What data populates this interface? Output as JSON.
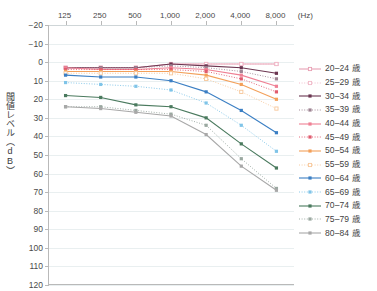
{
  "axes": {
    "y_title": "閾値レベル（dB）",
    "x_unit": "(Hz)",
    "x_ticks": [
      "125",
      "250",
      "500",
      "1,000",
      "2,000",
      "4,000",
      "8,000"
    ],
    "y_ticks": [
      "−20",
      "−10",
      "0",
      "10",
      "20",
      "30",
      "40",
      "50",
      "60",
      "70",
      "80",
      "90",
      "100",
      "110",
      "120"
    ]
  },
  "legend": {
    "items": [
      {
        "label": "20–24 歳",
        "color": "#e8a0b4",
        "dash": "solid",
        "marker": "square-open"
      },
      {
        "label": "25–29 歳",
        "color": "#f0b9c8",
        "dash": "dotted",
        "marker": "square-open"
      },
      {
        "label": "30–34 歳",
        "color": "#6b3550",
        "dash": "solid",
        "marker": "square-filled"
      },
      {
        "label": "35–39 歳",
        "color": "#9d8392",
        "dash": "dotted",
        "marker": "square-filled"
      },
      {
        "label": "40–44 歳",
        "color": "#ef8094",
        "dash": "solid",
        "marker": "square-filled"
      },
      {
        "label": "45–49 歳",
        "color": "#e05a6e",
        "dash": "dotted",
        "marker": "square-filled"
      },
      {
        "label": "50–54 歳",
        "color": "#f3a05a",
        "dash": "solid",
        "marker": "square-filled"
      },
      {
        "label": "55–59 歳",
        "color": "#f7c79a",
        "dash": "dotted",
        "marker": "square-open"
      },
      {
        "label": "60–64 歳",
        "color": "#3b7fc4",
        "dash": "solid",
        "marker": "square-filled"
      },
      {
        "label": "65–69 歳",
        "color": "#7fc4e8",
        "dash": "dotted",
        "marker": "square-filled"
      },
      {
        "label": "70–74 歳",
        "color": "#4a7a5e",
        "dash": "solid",
        "marker": "square-filled"
      },
      {
        "label": "75–79 歳",
        "color": "#9aa8a0",
        "dash": "dotted",
        "marker": "square-filled"
      },
      {
        "label": "80–84 歳",
        "color": "#a8a8a8",
        "dash": "solid",
        "marker": "square-filled"
      }
    ]
  },
  "chart_data": {
    "type": "line",
    "title": "",
    "xlabel": "(Hz)",
    "ylabel": "閾値レベル（dB）",
    "x": [
      125,
      250,
      500,
      1000,
      2000,
      4000,
      8000
    ],
    "x_tick_labels": [
      "125",
      "250",
      "500",
      "1,000",
      "2,000",
      "4,000",
      "8,000"
    ],
    "ylim": [
      -20,
      120
    ],
    "y_inverted": true,
    "y_ticks": [
      -20,
      -10,
      0,
      10,
      20,
      30,
      40,
      50,
      60,
      70,
      80,
      90,
      100,
      110,
      120
    ],
    "grid": true,
    "legend_position": "right",
    "series": [
      {
        "name": "20–24 歳",
        "color": "#e8a0b4",
        "dash": "solid",
        "marker": "square-open",
        "values": [
          3,
          3,
          3,
          1,
          1,
          1,
          1
        ]
      },
      {
        "name": "25–29 歳",
        "color": "#f0b9c8",
        "dash": "dotted",
        "marker": "square-open",
        "values": [
          3,
          3,
          3,
          1,
          1,
          1,
          1
        ]
      },
      {
        "name": "30–34 歳",
        "color": "#6b3550",
        "dash": "solid",
        "marker": "square-filled",
        "values": [
          3,
          3,
          3,
          1,
          2,
          3,
          6
        ]
      },
      {
        "name": "35–39 歳",
        "color": "#9d8392",
        "dash": "dotted",
        "marker": "square-filled",
        "values": [
          3,
          3,
          3,
          2,
          3,
          5,
          9
        ]
      },
      {
        "name": "40–44 歳",
        "color": "#ef8094",
        "dash": "solid",
        "marker": "square-filled",
        "values": [
          3,
          4,
          4,
          3,
          4,
          7,
          13
        ]
      },
      {
        "name": "45–49 歳",
        "color": "#e05a6e",
        "dash": "dotted",
        "marker": "square-filled",
        "values": [
          4,
          4,
          4,
          4,
          5,
          9,
          16
        ]
      },
      {
        "name": "50–54 歳",
        "color": "#f3a05a",
        "dash": "solid",
        "marker": "square-filled",
        "values": [
          5,
          5,
          5,
          5,
          7,
          12,
          20
        ]
      },
      {
        "name": "55–59 歳",
        "color": "#f7c79a",
        "dash": "dotted",
        "marker": "square-open",
        "values": [
          6,
          6,
          6,
          6,
          9,
          16,
          25
        ]
      },
      {
        "name": "60–64 歳",
        "color": "#3b7fc4",
        "dash": "solid",
        "marker": "square-filled",
        "values": [
          7,
          8,
          8,
          10,
          16,
          26,
          38
        ]
      },
      {
        "name": "65–69 歳",
        "color": "#7fc4e8",
        "dash": "dotted",
        "marker": "square-filled",
        "values": [
          11,
          12,
          13,
          15,
          22,
          34,
          48
        ]
      },
      {
        "name": "70–74 歳",
        "color": "#4a7a5e",
        "dash": "solid",
        "marker": "square-filled",
        "values": [
          18,
          19,
          23,
          24,
          30,
          44,
          57
        ]
      },
      {
        "name": "75–79 歳",
        "color": "#9aa8a0",
        "dash": "dotted",
        "marker": "square-filled",
        "values": [
          24,
          24,
          26,
          28,
          34,
          52,
          68
        ]
      },
      {
        "name": "80–84 歳",
        "color": "#a8a8a8",
        "dash": "solid",
        "marker": "square-filled",
        "values": [
          24,
          25,
          27,
          29,
          39,
          56,
          69
        ]
      }
    ]
  }
}
